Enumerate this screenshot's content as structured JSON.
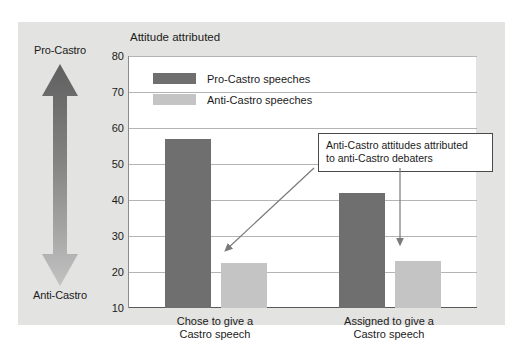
{
  "figure": {
    "title": "Attitude attributed",
    "attitude_axis": {
      "top_label": "Pro-Castro",
      "bottom_label": "Anti-Castro",
      "arrow_icon": "double-headed-vertical-arrow-icon"
    },
    "legend": [
      {
        "label": "Pro-Castro speeches",
        "color": "#6f6f6f"
      },
      {
        "label": "Anti-Castro speeches",
        "color": "#c4c4c4"
      }
    ],
    "callout": {
      "line1": "Anti-Castro attitudes attributed",
      "line2": "to anti-Castro debaters"
    }
  },
  "chart_data": {
    "type": "bar",
    "title": "Attitude attributed",
    "xlabel": "",
    "ylabel": "Attitude attributed",
    "ylim": [
      10,
      80
    ],
    "yticks": [
      10,
      20,
      30,
      40,
      50,
      60,
      70,
      80
    ],
    "grid": true,
    "legend_position": "top-left-inside",
    "categories": [
      "Chose to give a Castro speech",
      "Assigned to give a Castro speech"
    ],
    "category_lines": [
      [
        "Chose to give a",
        "Castro speech"
      ],
      [
        "Assigned to give a",
        "Castro speech"
      ]
    ],
    "series": [
      {
        "name": "Pro-Castro speeches",
        "color": "#6f6f6f",
        "values": [
          57,
          42
        ]
      },
      {
        "name": "Anti-Castro speeches",
        "color": "#c4c4c4",
        "values": [
          22.5,
          23
        ]
      }
    ],
    "annotations": [
      {
        "text": "Anti-Castro attitudes attributed to anti-Castro debaters",
        "points_to": [
          "Anti-Castro speeches @ Chose to give a Castro speech",
          "Anti-Castro speeches @ Assigned to give a Castro speech"
        ]
      }
    ]
  }
}
